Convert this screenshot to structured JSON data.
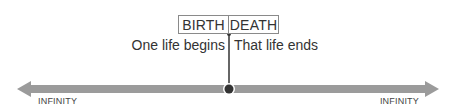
{
  "diagram": {
    "labels": {
      "left": "BIRTH",
      "right": "DEATH"
    },
    "captions": {
      "left": "One life begins",
      "right": "That life ends"
    },
    "axis": {
      "left_label": "INFINITY",
      "right_label": "INFINITY"
    },
    "colors": {
      "arrow": "#9b9b9b",
      "line": "#333333",
      "marker": "#333333",
      "box_border": "#8a8a8a"
    }
  }
}
